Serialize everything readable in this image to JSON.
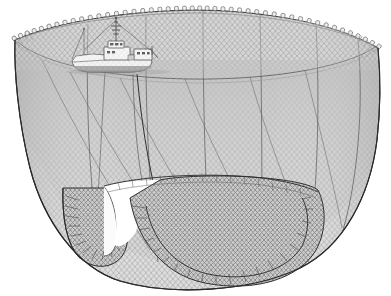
{
  "figure": {
    "title": "Purse seine net set by a fishing vessel",
    "background_color": "#ffffff",
    "width": 391,
    "height": 296,
    "style": "technical line illustration, monochrome grey"
  },
  "palette": {
    "background": "#ffffff",
    "outline": "#2b2b2b",
    "net_mesh_line": "#8e8e8e",
    "net_mesh_line_dark": "#6a6a6a",
    "net_fill_light": "#d8d8d8",
    "net_fill_mid": "#c4c4c4",
    "net_fill_shadow": "#b0b0b0",
    "float_fill": "#e9e9e9",
    "float_stroke": "#555555",
    "vessel_hull": "#ffffff",
    "vessel_hull_shadow": "#b9b9b9",
    "vessel_superstructure": "#fbfbfb",
    "vessel_detail": "#3a3a3a",
    "purse_line": "#3d3d3d",
    "water_line": "#777777"
  },
  "parts": {
    "float_line": {
      "label": "Float line (cork line)",
      "float_count": 46,
      "description": "Ring of small buoyant floats around the upper rim of the net"
    },
    "net_wall": {
      "label": "Net wall (webbing)",
      "description": "Bowl-shaped curtain of fine diamond mesh hanging from the float line"
    },
    "seams": {
      "label": "Vertical seam lines",
      "count": 6,
      "description": "Darker vertical joining seams dividing the webbing into panels"
    },
    "lead_line": {
      "label": "Lead line / purse line",
      "description": "Weighted bottom line drawn closed to purse the net"
    },
    "bunt": {
      "label": "Bunt",
      "description": "Heavy-meshed bag end of the seine at lower left where the catch gathers"
    },
    "purse_cable": {
      "label": "Purse cable",
      "description": "Line running from the vessel down through the net to the purse rings"
    },
    "vessel": {
      "label": "Purse seiner",
      "parts": [
        "hull",
        "bow",
        "wheelhouse",
        "deckhouse",
        "mast",
        "crosstree",
        "aerial",
        "stern-skiff-boom"
      ]
    },
    "far_rim": {
      "label": "Far side rim",
      "description": "The opposite edge of the circular float line seen across the net"
    }
  },
  "annotations": []
}
